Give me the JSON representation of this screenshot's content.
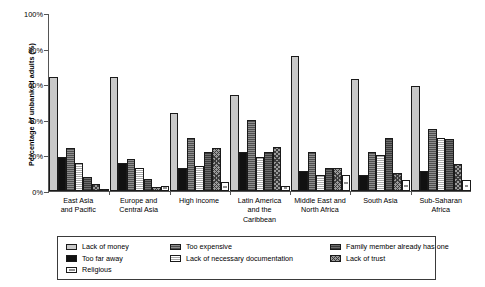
{
  "chart_data": {
    "type": "bar",
    "title": "",
    "xlabel": "",
    "ylabel": "Percentage of unbanked adults (%)",
    "ylim": [
      0,
      100
    ],
    "ytick_labels": [
      "0%",
      "20%",
      "40%",
      "60%",
      "80%",
      "100%"
    ],
    "ytick_values": [
      0,
      20,
      40,
      60,
      80,
      100
    ],
    "grid": false,
    "legend_position": "bottom",
    "categories": [
      "East Asia and Pacific",
      "Europe and Central Asia",
      "High income",
      "Latin America and the Caribbean",
      "Middle East and North Africa",
      "South Asia",
      "Sub-Saharan Africa"
    ],
    "category_lines": [
      [
        "East Asia",
        "and Pacific"
      ],
      [
        "Europe and",
        "Central Asia"
      ],
      [
        "High income",
        ""
      ],
      [
        "Latin America",
        "and the Caribbean"
      ],
      [
        "Middle East and",
        "North Africa"
      ],
      [
        "South Asia",
        ""
      ],
      [
        "Sub-Saharan",
        "Africa"
      ]
    ],
    "series": [
      {
        "name": "Lack of money",
        "values": [
          64,
          64,
          44,
          54,
          76,
          63,
          59
        ]
      },
      {
        "name": "Too far away",
        "values": [
          19,
          16,
          13,
          22,
          11,
          9,
          11
        ]
      },
      {
        "name": "Too expensive",
        "values": [
          24,
          18,
          30,
          40,
          22,
          22,
          35
        ]
      },
      {
        "name": "Lack of necessary documentation",
        "values": [
          16,
          13,
          14,
          19,
          9,
          20,
          30
        ]
      },
      {
        "name": "Family member already has one",
        "values": [
          8,
          7,
          22,
          22,
          13,
          30,
          29
        ]
      },
      {
        "name": "Lack of trust",
        "values": [
          4,
          2,
          24,
          25,
          13,
          10,
          15
        ]
      },
      {
        "name": "Religious",
        "values": [
          1,
          3,
          5,
          3,
          9,
          6,
          6
        ]
      }
    ]
  },
  "legend": {
    "items": [
      {
        "label": "Lack of money",
        "swatch": "s0"
      },
      {
        "label": "Too expensive",
        "swatch": "s2"
      },
      {
        "label": "Family member already has one",
        "swatch": "s4"
      },
      {
        "label": "Too far away",
        "swatch": "s1"
      },
      {
        "label": "Lack of necessary documentation",
        "swatch": "s3"
      },
      {
        "label": "Lack of trust",
        "swatch": "s5"
      },
      {
        "label": "Religious",
        "swatch": "s6"
      }
    ]
  }
}
